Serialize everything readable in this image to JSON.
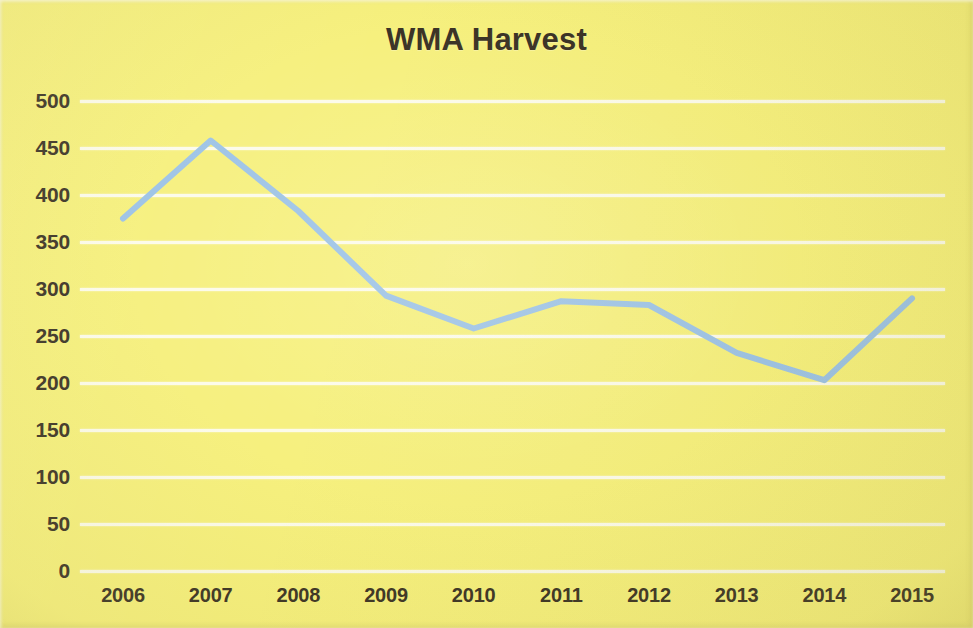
{
  "chart": {
    "title": "WMA Harvest",
    "background_color": "#f6f07e",
    "gridline_color": "#fdfdf4",
    "text_color": "#3b3326",
    "series_color": "#9dc3e6"
  },
  "chart_data": {
    "type": "line",
    "title": "WMA Harvest",
    "subtitle": "",
    "xlabel": "",
    "ylabel": "",
    "categories": [
      "2006",
      "2007",
      "2008",
      "2009",
      "2010",
      "2011",
      "2012",
      "2013",
      "2014",
      "2015"
    ],
    "values": [
      375,
      458,
      383,
      293,
      258,
      287,
      283,
      232,
      203,
      290
    ],
    "series": [
      {
        "name": "WMA Harvest",
        "color": "#9dc3e6",
        "values": [
          375,
          458,
          383,
          293,
          258,
          287,
          283,
          232,
          203,
          290
        ]
      }
    ],
    "ylim": [
      0,
      500
    ],
    "ytick_values": [
      0,
      50,
      100,
      150,
      200,
      250,
      300,
      350,
      400,
      450,
      500
    ],
    "ytick_labels": [
      "0",
      "50",
      "100",
      "150",
      "200",
      "250",
      "300",
      "350",
      "400",
      "450",
      "500"
    ],
    "xtick_labels": [
      "2006",
      "2007",
      "2008",
      "2009",
      "2010",
      "2011",
      "2012",
      "2013",
      "2014",
      "2015"
    ],
    "grid": "horizontal",
    "legend": "none",
    "markers": "none",
    "line_width": 6
  }
}
